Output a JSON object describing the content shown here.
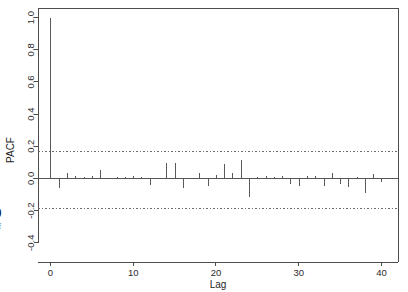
{
  "figure": {
    "caption_number": "9",
    "caption_lines": [
      "of",
      "n",
      "0."
    ]
  },
  "chart_data": {
    "type": "bar",
    "title": "",
    "subtitle": "",
    "xlabel": "Lag",
    "ylabel": "PACF",
    "xlim": [
      -1.5,
      42
    ],
    "ylim": [
      -0.52,
      1.06
    ],
    "grid": false,
    "legend": null,
    "x_ticks": [
      0,
      10,
      20,
      30,
      40
    ],
    "x_tick_labels": [
      "0",
      "10",
      "20",
      "30",
      "40"
    ],
    "y_ticks": [
      1.0,
      0.8,
      0.6,
      0.4,
      0.2,
      0.0,
      -0.2,
      -0.4
    ],
    "y_tick_labels": [
      "1.0",
      "0.8",
      "0.6",
      "0.4",
      "0.2",
      "0.0",
      "-0.2",
      "-0.4"
    ],
    "confidence_bands": {
      "upper": 0.17,
      "lower": -0.19,
      "style": "dotted"
    },
    "zero_reference": 0.0,
    "categories": [
      0,
      1,
      2,
      3,
      4,
      5,
      6,
      7,
      8,
      9,
      10,
      11,
      12,
      13,
      14,
      15,
      16,
      17,
      18,
      19,
      20,
      21,
      22,
      23,
      24,
      25,
      26,
      27,
      28,
      29,
      30,
      31,
      32,
      33,
      34,
      35,
      36,
      37,
      38,
      39,
      40,
      41
    ],
    "values": [
      1.0,
      -0.06,
      0.035,
      0.012,
      0.01,
      0.012,
      0.055,
      0.005,
      0.01,
      0.008,
      0.012,
      0.007,
      -0.04,
      0.005,
      0.095,
      0.098,
      -0.06,
      0.004,
      0.035,
      -0.048,
      0.02,
      0.09,
      0.035,
      0.115,
      -0.115,
      0.006,
      0.012,
      0.008,
      0.016,
      -0.035,
      -0.05,
      0.018,
      0.012,
      -0.05,
      0.032,
      -0.035,
      -0.055,
      0.01,
      -0.088,
      0.028,
      -0.02,
      0.004
    ],
    "series_name": "PACF"
  }
}
